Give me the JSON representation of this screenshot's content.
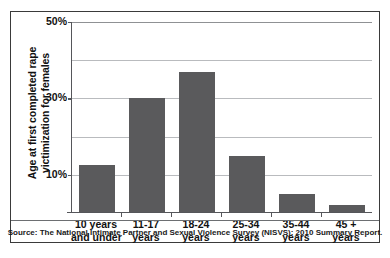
{
  "chart_data": {
    "type": "bar",
    "title": "",
    "xlabel": "",
    "ylabel": "Age at first completed rape victimization for females",
    "ylabel_lines": [
      "Age at first completed rape",
      "victimization for females"
    ],
    "categories": [
      "10 years and under",
      "11-17 years",
      "18-24 years",
      "25-34 years",
      "35-44 years",
      "45 + years"
    ],
    "category_lines": [
      [
        "10 years",
        "and under"
      ],
      [
        "11-17",
        "years"
      ],
      [
        "18-24",
        "years"
      ],
      [
        "25-34",
        "years"
      ],
      [
        "35-44",
        "years"
      ],
      [
        "45 +",
        "years"
      ]
    ],
    "values": [
      12.5,
      30,
      37,
      15,
      5,
      2
    ],
    "ylim": [
      0,
      50
    ],
    "ytick_values": [
      10,
      30,
      50
    ],
    "ytick_labels": [
      "10%",
      "30%",
      "50%"
    ],
    "gridline_values": [
      10,
      20,
      30,
      40,
      50
    ],
    "grid": true,
    "legend": "none",
    "bar_color": "#5a5a5c",
    "grid_color": "#b9bbbe",
    "axis_color": "#55565a"
  },
  "source": {
    "note": "Source: The National Intimate Partner and Sexual Violence Survey (NISVS): 2010 Summary Report."
  }
}
